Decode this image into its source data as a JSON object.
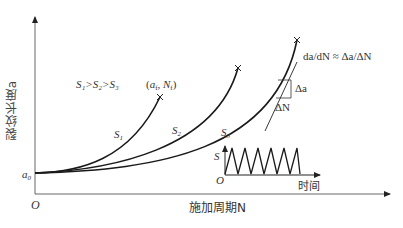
{
  "diagram": {
    "y_axis_label": "裂纹长度a",
    "x_axis_label": "施加周期N",
    "origin_label": "O",
    "a0_label": "a",
    "a0_sub": "0",
    "stress_relation": "S₁>S₂>S₃",
    "failure_point_label": "(a_f, N_f)",
    "failure_point_a": "a",
    "failure_point_a_sub": "f",
    "failure_point_n": "N",
    "failure_point_n_sub": "f",
    "curves": [
      {
        "label": "S",
        "sub": "1"
      },
      {
        "label": "S",
        "sub": "2"
      },
      {
        "label": "S",
        "sub": "3"
      }
    ],
    "slope_formula": "da/dN ≈ Δa/ΔN",
    "delta_a": "Δa",
    "delta_n": "ΔN",
    "inset": {
      "y_label": "S",
      "origin_label": "O",
      "x_label": "时间",
      "cycles": 6
    }
  },
  "colors": {
    "line": "#1a1a1a",
    "axis": "#555555",
    "text": "#333333"
  }
}
